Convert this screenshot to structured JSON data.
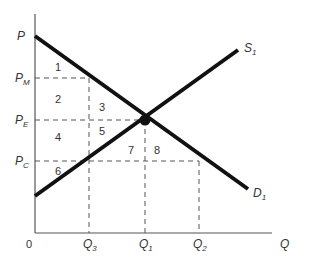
{
  "diagram": {
    "type": "supply-demand",
    "axes": {
      "y_label": "P",
      "x_label": "Q",
      "origin_label": "0"
    },
    "curves": {
      "supply": {
        "label": "S",
        "sub": "1"
      },
      "demand": {
        "label": "D",
        "sub": "1"
      }
    },
    "price_levels": [
      {
        "label": "P",
        "sub": "M"
      },
      {
        "label": "P",
        "sub": "E"
      },
      {
        "label": "P",
        "sub": "C"
      }
    ],
    "quantity_levels": [
      {
        "label": "Q",
        "sub": "3"
      },
      {
        "label": "Q",
        "sub": "1"
      },
      {
        "label": "Q",
        "sub": "2"
      }
    ],
    "regions": [
      "1",
      "2",
      "3",
      "4",
      "5",
      "6",
      "7",
      "8"
    ],
    "equilibrium": {
      "price": "P_E",
      "quantity": "Q_1"
    },
    "colors": {
      "curve": "#111111",
      "axis": "#555555",
      "guide": "#555555",
      "text": "#333333"
    }
  }
}
